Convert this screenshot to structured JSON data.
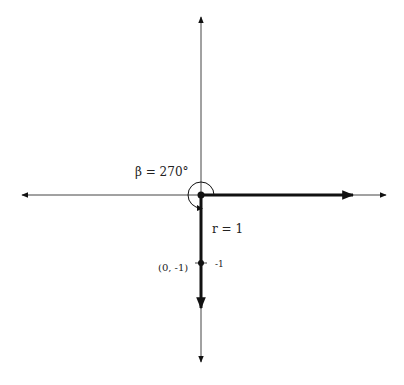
{
  "diagram": {
    "angle_label": "β = 270°",
    "radius_label": "r = 1",
    "point_label": "(0, -1)",
    "tick_label": "-1",
    "colors": {
      "axis": "#333333",
      "ray": "#111111",
      "background": "#ffffff"
    },
    "origin": {
      "x": 201,
      "y": 195
    },
    "x_axis": {
      "x1": 22,
      "x2": 386
    },
    "y_axis": {
      "y1": 17,
      "y2": 362
    },
    "initial_ray_end_x": 353,
    "terminal_ray_end_y": 308
  }
}
